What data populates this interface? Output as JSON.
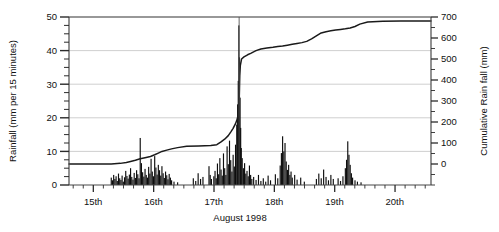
{
  "chart_data": {
    "type": "line",
    "title": "",
    "xlabel": "August 1998",
    "ylabel": "Rainfall (mm per 15 minutes)",
    "y2label": "Cumulative Rain fall (mm)",
    "xlim": [
      14.6,
      20.6
    ],
    "ylim": [
      0,
      50
    ],
    "y2lim": [
      -100,
      700
    ],
    "grid": true,
    "legend_position": "none",
    "x_ticks": [
      15,
      16,
      17,
      18,
      19,
      20
    ],
    "x_tick_labels": [
      "15th",
      "16th",
      "17th",
      "18th",
      "19th",
      "20th"
    ],
    "x_minor_tick_interval": 0.1667,
    "y_ticks": [
      0,
      10,
      20,
      30,
      40,
      50
    ],
    "y_tick_labels": [
      "0",
      "10",
      "20",
      "30",
      "40",
      "50"
    ],
    "y_minor_tick_interval": 2.5,
    "y2_ticks": [
      0,
      100,
      200,
      300,
      400,
      500,
      600,
      700
    ],
    "y2_tick_labels": [
      "0",
      "100",
      "200",
      "300",
      "400",
      "500",
      "600",
      "700"
    ],
    "annotations": [
      {
        "name": "event-marker",
        "type": "vertical-line",
        "x": 17.42
      }
    ],
    "series": [
      {
        "name": "Cumulative Rain fall (mm)",
        "axis": "right",
        "type": "line",
        "color": "#1a1a1a",
        "x": [
          14.6,
          15.0,
          15.3,
          15.45,
          15.55,
          15.62,
          15.7,
          15.78,
          15.86,
          15.95,
          16.02,
          16.08,
          16.14,
          16.22,
          16.3,
          16.4,
          16.55,
          16.75,
          16.95,
          17.05,
          17.12,
          17.18,
          17.24,
          17.28,
          17.32,
          17.36,
          17.39,
          17.41,
          17.42,
          17.425,
          17.43,
          17.44,
          17.46,
          17.5,
          17.56,
          17.62,
          17.7,
          17.78,
          17.88,
          17.98,
          18.06,
          18.14,
          18.22,
          18.3,
          18.38,
          18.46,
          18.54,
          18.62,
          18.7,
          18.78,
          18.86,
          18.94,
          19.02,
          19.1,
          19.18,
          19.26,
          19.34,
          19.42,
          19.55,
          19.8,
          20.1,
          20.4,
          20.6
        ],
        "y": [
          0,
          0,
          0,
          3,
          7,
          12,
          18,
          25,
          30,
          36,
          44,
          52,
          60,
          66,
          72,
          78,
          84,
          86,
          88,
          92,
          105,
          118,
          135,
          152,
          170,
          192,
          215,
          248,
          300,
          360,
          420,
          470,
          500,
          510,
          520,
          528,
          540,
          548,
          552,
          556,
          560,
          562,
          566,
          570,
          574,
          578,
          584,
          596,
          610,
          624,
          630,
          634,
          638,
          641,
          644,
          648,
          655,
          666,
          676,
          680,
          681,
          681,
          681
        ]
      },
      {
        "name": "Rainfall (mm per 15 minutes)",
        "axis": "left",
        "type": "bar",
        "color": "#0d0d0d",
        "bars": [
          {
            "x": 15.3,
            "y": 2.2
          },
          {
            "x": 15.32,
            "y": 1.4
          },
          {
            "x": 15.34,
            "y": 3.0
          },
          {
            "x": 15.36,
            "y": 1.8
          },
          {
            "x": 15.38,
            "y": 2.6
          },
          {
            "x": 15.4,
            "y": 1.2
          },
          {
            "x": 15.42,
            "y": 3.4
          },
          {
            "x": 15.44,
            "y": 2.0
          },
          {
            "x": 15.46,
            "y": 1.5
          },
          {
            "x": 15.48,
            "y": 2.8
          },
          {
            "x": 15.5,
            "y": 1.0
          },
          {
            "x": 15.52,
            "y": 2.3
          },
          {
            "x": 15.54,
            "y": 4.2
          },
          {
            "x": 15.56,
            "y": 2.7
          },
          {
            "x": 15.58,
            "y": 1.9
          },
          {
            "x": 15.6,
            "y": 3.1
          },
          {
            "x": 15.62,
            "y": 5.0
          },
          {
            "x": 15.64,
            "y": 2.4
          },
          {
            "x": 15.66,
            "y": 1.6
          },
          {
            "x": 15.68,
            "y": 3.6
          },
          {
            "x": 15.7,
            "y": 2.1
          },
          {
            "x": 15.72,
            "y": 4.4
          },
          {
            "x": 15.74,
            "y": 3.2
          },
          {
            "x": 15.76,
            "y": 2.0
          },
          {
            "x": 15.78,
            "y": 14.0
          },
          {
            "x": 15.8,
            "y": 6.5
          },
          {
            "x": 15.82,
            "y": 3.8
          },
          {
            "x": 15.84,
            "y": 2.5
          },
          {
            "x": 15.86,
            "y": 4.8
          },
          {
            "x": 15.88,
            "y": 3.0
          },
          {
            "x": 15.9,
            "y": 2.2
          },
          {
            "x": 15.92,
            "y": 5.4
          },
          {
            "x": 15.94,
            "y": 3.4
          },
          {
            "x": 15.96,
            "y": 7.8
          },
          {
            "x": 15.98,
            "y": 4.0
          },
          {
            "x": 16.0,
            "y": 2.6
          },
          {
            "x": 16.02,
            "y": 8.6
          },
          {
            "x": 16.04,
            "y": 5.2
          },
          {
            "x": 16.06,
            "y": 3.1
          },
          {
            "x": 16.08,
            "y": 6.0
          },
          {
            "x": 16.1,
            "y": 4.4
          },
          {
            "x": 16.12,
            "y": 2.8
          },
          {
            "x": 16.14,
            "y": 5.6
          },
          {
            "x": 16.16,
            "y": 3.5
          },
          {
            "x": 16.18,
            "y": 2.1
          },
          {
            "x": 16.2,
            "y": 4.0
          },
          {
            "x": 16.22,
            "y": 2.9
          },
          {
            "x": 16.24,
            "y": 1.7
          },
          {
            "x": 16.26,
            "y": 3.3
          },
          {
            "x": 16.28,
            "y": 2.2
          },
          {
            "x": 16.3,
            "y": 1.4
          },
          {
            "x": 16.34,
            "y": 1.0
          },
          {
            "x": 16.4,
            "y": 0.8
          },
          {
            "x": 16.66,
            "y": 2.0
          },
          {
            "x": 16.7,
            "y": 1.2
          },
          {
            "x": 16.74,
            "y": 3.5
          },
          {
            "x": 16.78,
            "y": 1.8
          },
          {
            "x": 16.82,
            "y": 2.4
          },
          {
            "x": 16.92,
            "y": 5.6
          },
          {
            "x": 16.94,
            "y": 3.0
          },
          {
            "x": 16.96,
            "y": 1.8
          },
          {
            "x": 17.0,
            "y": 2.6
          },
          {
            "x": 17.02,
            "y": 4.2
          },
          {
            "x": 17.04,
            "y": 2.0
          },
          {
            "x": 17.06,
            "y": 6.4
          },
          {
            "x": 17.08,
            "y": 3.2
          },
          {
            "x": 17.1,
            "y": 8.0
          },
          {
            "x": 17.12,
            "y": 4.6
          },
          {
            "x": 17.14,
            "y": 2.8
          },
          {
            "x": 17.16,
            "y": 9.4
          },
          {
            "x": 17.18,
            "y": 5.0
          },
          {
            "x": 17.2,
            "y": 3.0
          },
          {
            "x": 17.22,
            "y": 11.5
          },
          {
            "x": 17.24,
            "y": 6.2
          },
          {
            "x": 17.26,
            "y": 13.2
          },
          {
            "x": 17.28,
            "y": 7.4
          },
          {
            "x": 17.3,
            "y": 4.0
          },
          {
            "x": 17.32,
            "y": 9.0
          },
          {
            "x": 17.34,
            "y": 5.5
          },
          {
            "x": 17.36,
            "y": 12.0
          },
          {
            "x": 17.38,
            "y": 18.0
          },
          {
            "x": 17.395,
            "y": 24.0
          },
          {
            "x": 17.405,
            "y": 31.0
          },
          {
            "x": 17.415,
            "y": 47.5
          },
          {
            "x": 17.425,
            "y": 38.0
          },
          {
            "x": 17.435,
            "y": 26.0
          },
          {
            "x": 17.445,
            "y": 17.0
          },
          {
            "x": 17.455,
            "y": 11.0
          },
          {
            "x": 17.47,
            "y": 8.0
          },
          {
            "x": 17.49,
            "y": 5.0
          },
          {
            "x": 17.51,
            "y": 6.5
          },
          {
            "x": 17.53,
            "y": 3.4
          },
          {
            "x": 17.55,
            "y": 4.2
          },
          {
            "x": 17.57,
            "y": 2.6
          },
          {
            "x": 17.59,
            "y": 5.8
          },
          {
            "x": 17.61,
            "y": 3.0
          },
          {
            "x": 17.63,
            "y": 1.8
          },
          {
            "x": 17.66,
            "y": 2.4
          },
          {
            "x": 17.7,
            "y": 1.5
          },
          {
            "x": 17.74,
            "y": 3.0
          },
          {
            "x": 17.78,
            "y": 1.2
          },
          {
            "x": 17.82,
            "y": 2.0
          },
          {
            "x": 17.86,
            "y": 1.0
          },
          {
            "x": 17.9,
            "y": 2.8
          },
          {
            "x": 17.94,
            "y": 1.4
          },
          {
            "x": 18.02,
            "y": 3.2
          },
          {
            "x": 18.06,
            "y": 2.0
          },
          {
            "x": 18.1,
            "y": 5.8
          },
          {
            "x": 18.12,
            "y": 9.5
          },
          {
            "x": 18.14,
            "y": 14.5
          },
          {
            "x": 18.16,
            "y": 10.0
          },
          {
            "x": 18.18,
            "y": 12.5
          },
          {
            "x": 18.2,
            "y": 7.0
          },
          {
            "x": 18.22,
            "y": 4.5
          },
          {
            "x": 18.24,
            "y": 6.0
          },
          {
            "x": 18.26,
            "y": 3.0
          },
          {
            "x": 18.28,
            "y": 4.0
          },
          {
            "x": 18.3,
            "y": 2.2
          },
          {
            "x": 18.34,
            "y": 3.0
          },
          {
            "x": 18.38,
            "y": 1.6
          },
          {
            "x": 18.44,
            "y": 2.2
          },
          {
            "x": 18.5,
            "y": 1.0
          },
          {
            "x": 18.7,
            "y": 1.8
          },
          {
            "x": 18.74,
            "y": 3.4
          },
          {
            "x": 18.78,
            "y": 2.0
          },
          {
            "x": 18.82,
            "y": 4.6
          },
          {
            "x": 18.86,
            "y": 2.4
          },
          {
            "x": 18.9,
            "y": 1.4
          },
          {
            "x": 18.94,
            "y": 3.0
          },
          {
            "x": 18.98,
            "y": 1.8
          },
          {
            "x": 19.06,
            "y": 2.0
          },
          {
            "x": 19.1,
            "y": 1.2
          },
          {
            "x": 19.14,
            "y": 2.6
          },
          {
            "x": 19.18,
            "y": 5.0
          },
          {
            "x": 19.2,
            "y": 7.5
          },
          {
            "x": 19.22,
            "y": 13.0
          },
          {
            "x": 19.24,
            "y": 9.0
          },
          {
            "x": 19.26,
            "y": 6.0
          },
          {
            "x": 19.28,
            "y": 3.5
          },
          {
            "x": 19.3,
            "y": 2.2
          },
          {
            "x": 19.34,
            "y": 1.4
          },
          {
            "x": 19.38,
            "y": 1.0
          },
          {
            "x": 19.44,
            "y": 0.8
          }
        ]
      }
    ]
  },
  "layout": {
    "plot": {
      "left": 69,
      "right": 431,
      "top": 17,
      "bottom": 185
    }
  }
}
